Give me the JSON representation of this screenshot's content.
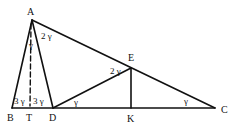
{
  "diagram": {
    "type": "geometry",
    "points": {
      "A": {
        "label": "A",
        "x": 32,
        "y": 20
      },
      "B": {
        "label": "B",
        "x": 12,
        "y": 108
      },
      "T": {
        "label": "T",
        "x": 30,
        "y": 108
      },
      "D": {
        "label": "D",
        "x": 53,
        "y": 108
      },
      "E": {
        "label": "E",
        "x": 131,
        "y": 68
      },
      "K": {
        "label": "K",
        "x": 131,
        "y": 108
      },
      "C": {
        "label": "C",
        "x": 215,
        "y": 108
      }
    },
    "segments": [
      {
        "from": "A",
        "to": "B",
        "style": "solid"
      },
      {
        "from": "A",
        "to": "D",
        "style": "solid"
      },
      {
        "from": "A",
        "to": "C",
        "style": "solid"
      },
      {
        "from": "B",
        "to": "C",
        "style": "solid"
      },
      {
        "from": "D",
        "to": "E",
        "style": "solid"
      },
      {
        "from": "E",
        "to": "K",
        "style": "solid"
      },
      {
        "from": "A",
        "to": "T",
        "style": "dashed"
      }
    ],
    "angle_labels": {
      "at_A_TAD": "γ",
      "at_A_DAC": "2 γ",
      "at_B": "3 γ",
      "at_D_ADB": "3 γ",
      "at_D_EDC": "γ",
      "at_E_DEA": "2 γ",
      "at_C": "γ"
    }
  }
}
